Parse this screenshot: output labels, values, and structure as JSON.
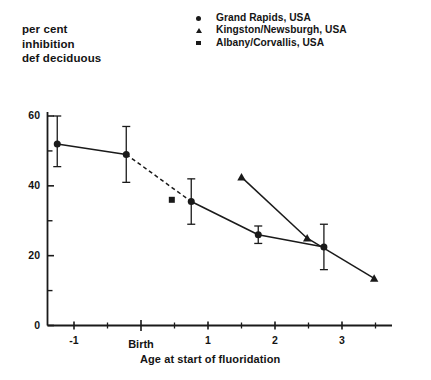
{
  "chart_data": {
    "type": "line",
    "title": "",
    "ylabel": "per cent inhibition def deciduous",
    "ylabel_lines": [
      "per cent",
      "inhibition",
      "def deciduous"
    ],
    "xlabel": "Age at start of fluoridation",
    "xlim": [
      -1.6,
      3.9
    ],
    "ylim": [
      0,
      66
    ],
    "ytick_labels": [
      "0",
      "20",
      "40",
      "60"
    ],
    "ytick_values": [
      0,
      20,
      40,
      60
    ],
    "yminor_values": [
      10,
      30,
      50
    ],
    "xtick_labels": [
      "-1",
      "Birth",
      "1",
      "2",
      "3"
    ],
    "xtick_values": [
      -1,
      0,
      1,
      2,
      3
    ],
    "xminor_values": [
      -0.5,
      0.5,
      1.5,
      2.5,
      3.5
    ],
    "grid": false,
    "legend_position": "top-right",
    "series": [
      {
        "name": "Grand Rapids, USA",
        "marker": "circle",
        "connected": true,
        "points": [
          {
            "x": -1.25,
            "y": 52,
            "yerr_low": 45.5,
            "yerr_high": 60
          },
          {
            "x": -0.22,
            "y": 49,
            "yerr_low": 41,
            "yerr_high": 57
          },
          {
            "x": 0.75,
            "y": 35.5,
            "yerr_low": 29,
            "yerr_high": 42
          },
          {
            "x": 1.75,
            "y": 26,
            "yerr_low": 23.5,
            "yerr_high": 28.5
          },
          {
            "x": 2.73,
            "y": 22.5,
            "yerr_low": 16,
            "yerr_high": 29
          }
        ]
      },
      {
        "name": "Kingston/Newsburgh, USA",
        "marker": "triangle",
        "connected": true,
        "points": [
          {
            "x": 1.5,
            "y": 42.5
          },
          {
            "x": 2.48,
            "y": 25
          },
          {
            "x": 3.48,
            "y": 13.5
          }
        ]
      },
      {
        "name": "Albany/Corvallis, USA",
        "marker": "square",
        "connected": false,
        "points": [
          {
            "x": 0.46,
            "y": 36
          }
        ]
      }
    ],
    "annotations": [
      {
        "text": "dashed segment between Grand Rapids points at x=-0.22 and x=0.75"
      }
    ]
  },
  "legend": {
    "items": [
      {
        "marker": "circle-marker",
        "label": "Grand Rapids, USA"
      },
      {
        "marker": "triangle-marker",
        "label": "Kingston/Newsburgh, USA"
      },
      {
        "marker": "square-marker",
        "label": "Albany/Corvallis, USA"
      }
    ]
  },
  "axes": {
    "y_title_line1": "per cent",
    "y_title_line2": "inhibition",
    "y_title_line3": "def deciduous",
    "x_caption": "Age at start of fluoridation",
    "y_labels": {
      "t0": "0",
      "t20": "20",
      "t40": "40",
      "t60": "60"
    },
    "x_labels": {
      "m1": "-1",
      "birth": "Birth",
      "p1": "1",
      "p2": "2",
      "p3": "3"
    }
  },
  "colors": {
    "ink": "#1a1a1a",
    "background": "#ffffff"
  }
}
